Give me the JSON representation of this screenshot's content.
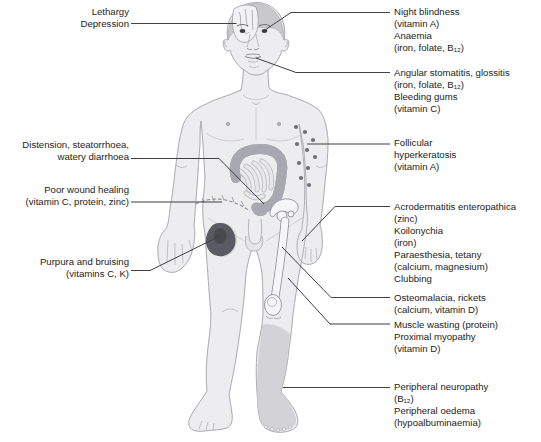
{
  "colors": {
    "body_fill": "#ededf0",
    "body_outline": "#a6a6ac",
    "bruise": "#5a5a62",
    "bone": "#f6f6f8",
    "leader_line": "#3f3f44",
    "text": "#1c1c1c"
  },
  "annotations": {
    "left": [
      {
        "id": "lethargy-depression",
        "target": "brain",
        "lines": [
          "Lethargy",
          "Depression"
        ]
      },
      {
        "id": "distension",
        "target": "intestines",
        "lines": [
          "Distension, steatorrhoea,",
          "watery diarrhoea"
        ]
      },
      {
        "id": "poor-wound-healing",
        "target": "abdominal-scar",
        "lines": [
          "Poor wound healing",
          "(vitamin C, protein, zinc)"
        ]
      },
      {
        "id": "purpura-bruising",
        "target": "thigh-bruise",
        "lines": [
          "Purpura and bruising",
          "(vitamins C, K)"
        ]
      }
    ],
    "right": [
      {
        "id": "night-blindness-anaemia",
        "target": "eye",
        "lines": [
          "Night blindness",
          "(vitamin A)",
          "Anaemia",
          "(iron, folate, B₁₂)"
        ]
      },
      {
        "id": "angular-stomatitis",
        "target": "mouth",
        "lines": [
          "Angular stomatitis, glossitis",
          "(iron, folate, B₁₂)",
          "Bleeding gums",
          "(vitamin C)"
        ]
      },
      {
        "id": "follicular-hyperkeratosis",
        "target": "arm-papules",
        "lines": [
          "Follicular",
          "hyperkeratosis",
          "(vitamin A)"
        ]
      },
      {
        "id": "acrodermatitis",
        "target": "hand",
        "lines": [
          "Acrodermatitis enteropathica",
          "(zinc)",
          "Koilonychia",
          "(iron)",
          "Paraesthesia, tetany",
          "(calcium, magnesium)",
          "Clubbing"
        ]
      },
      {
        "id": "osteomalacia-rickets",
        "target": "femur",
        "lines": [
          "Osteomalacia, rickets",
          "(calcium, vitamin D)"
        ]
      },
      {
        "id": "muscle-wasting",
        "target": "thigh-muscle",
        "lines": [
          "Muscle wasting (protein)",
          "Proximal myopathy",
          "(vitamin D)"
        ]
      },
      {
        "id": "peripheral-neuropathy",
        "target": "lower-leg",
        "lines": [
          "Peripheral neuropathy",
          "(B₁₂)",
          "Peripheral oedema",
          "(hypoalbuminaemia)"
        ]
      }
    ]
  }
}
